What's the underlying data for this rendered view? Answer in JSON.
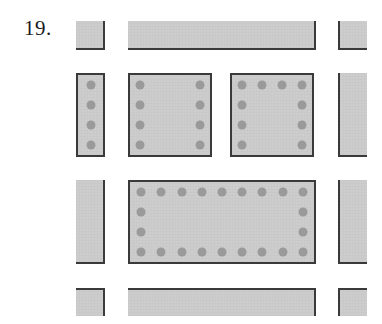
{
  "figure": {
    "problem_number": "19.",
    "caption": "",
    "colors": {
      "fill": "#cdcdcd",
      "edge": "#3a3a3a",
      "dot": "#9a9a9a",
      "background": "#ffffff",
      "text": "#1a1a1a"
    },
    "elements": [
      {
        "id": "top-left-corner-block",
        "name": "top-left-column",
        "x": 76,
        "y": 21,
        "w": 29,
        "h": 29,
        "edge": "edge-rb",
        "dots": []
      },
      {
        "id": "top-beam",
        "name": "top-horizontal-beam",
        "x": 128,
        "y": 21,
        "w": 188,
        "h": 29,
        "edge": "edge-rb",
        "dots": []
      },
      {
        "id": "top-right-corner-block",
        "name": "top-right-column",
        "x": 338,
        "y": 21,
        "w": 29,
        "h": 29,
        "edge": "edge-lb",
        "dots": []
      },
      {
        "id": "mid-left-bar",
        "name": "middle-left-column",
        "x": 76,
        "y": 73,
        "w": 29,
        "h": 84,
        "edge": "edge-all",
        "dots": [
          {
            "cx": 50,
            "cy": 12
          },
          {
            "cx": 50,
            "cy": 38
          },
          {
            "cx": 50,
            "cy": 62
          },
          {
            "cx": 50,
            "cy": 87
          }
        ]
      },
      {
        "id": "mid-center-square",
        "name": "middle-center-slab",
        "x": 128,
        "y": 73,
        "w": 84,
        "h": 84,
        "edge": "edge-all",
        "dots": [
          {
            "cx": 13,
            "cy": 12
          },
          {
            "cx": 13,
            "cy": 38
          },
          {
            "cx": 13,
            "cy": 62
          },
          {
            "cx": 13,
            "cy": 87
          },
          {
            "cx": 87,
            "cy": 12
          },
          {
            "cx": 87,
            "cy": 38
          },
          {
            "cx": 87,
            "cy": 62
          },
          {
            "cx": 87,
            "cy": 87
          }
        ]
      },
      {
        "id": "mid-right-square",
        "name": "middle-right-slab",
        "x": 230,
        "y": 73,
        "w": 84,
        "h": 84,
        "edge": "edge-all",
        "dots": [
          {
            "cx": 13,
            "cy": 12
          },
          {
            "cx": 37,
            "cy": 12
          },
          {
            "cx": 62,
            "cy": 12
          },
          {
            "cx": 87,
            "cy": 12
          },
          {
            "cx": 13,
            "cy": 38
          },
          {
            "cx": 87,
            "cy": 38
          },
          {
            "cx": 13,
            "cy": 62
          },
          {
            "cx": 87,
            "cy": 62
          },
          {
            "cx": 13,
            "cy": 87
          },
          {
            "cx": 87,
            "cy": 87
          }
        ]
      },
      {
        "id": "mid-far-right-bar",
        "name": "middle-far-right-column",
        "x": 338,
        "y": 73,
        "w": 29,
        "h": 84,
        "edge": "edge-lb",
        "dots": []
      },
      {
        "id": "low-left-bar",
        "name": "lower-left-column",
        "x": 76,
        "y": 180,
        "w": 29,
        "h": 84,
        "edge": "edge-rb",
        "dots": []
      },
      {
        "id": "low-center-rect",
        "name": "lower-center-slab",
        "x": 128,
        "y": 180,
        "w": 188,
        "h": 84,
        "edge": "edge-all",
        "dots": [
          {
            "cx": 6,
            "cy": 12
          },
          {
            "cx": 17,
            "cy": 12
          },
          {
            "cx": 28,
            "cy": 12
          },
          {
            "cx": 39,
            "cy": 12
          },
          {
            "cx": 50,
            "cy": 12
          },
          {
            "cx": 61,
            "cy": 12
          },
          {
            "cx": 72,
            "cy": 12
          },
          {
            "cx": 83,
            "cy": 12
          },
          {
            "cx": 94,
            "cy": 12
          },
          {
            "cx": 6,
            "cy": 38
          },
          {
            "cx": 94,
            "cy": 38
          },
          {
            "cx": 6,
            "cy": 62
          },
          {
            "cx": 94,
            "cy": 62
          },
          {
            "cx": 6,
            "cy": 87
          },
          {
            "cx": 17,
            "cy": 87
          },
          {
            "cx": 28,
            "cy": 87
          },
          {
            "cx": 39,
            "cy": 87
          },
          {
            "cx": 50,
            "cy": 87
          },
          {
            "cx": 61,
            "cy": 87
          },
          {
            "cx": 72,
            "cy": 87
          },
          {
            "cx": 83,
            "cy": 87
          },
          {
            "cx": 94,
            "cy": 87
          }
        ]
      },
      {
        "id": "low-far-right-bar",
        "name": "lower-far-right-column",
        "x": 338,
        "y": 180,
        "w": 29,
        "h": 84,
        "edge": "edge-lb",
        "dots": []
      },
      {
        "id": "bottom-left-block",
        "name": "bottom-left-column",
        "x": 76,
        "y": 288,
        "w": 29,
        "h": 28,
        "edge": "edge-rt",
        "dots": []
      },
      {
        "id": "bottom-beam",
        "name": "bottom-horizontal-beam",
        "x": 128,
        "y": 288,
        "w": 188,
        "h": 28,
        "edge": "edge-rt",
        "dots": []
      },
      {
        "id": "bottom-right-block",
        "name": "bottom-right-column",
        "x": 338,
        "y": 288,
        "w": 29,
        "h": 28,
        "edge": "edge-lt",
        "dots": []
      }
    ]
  }
}
